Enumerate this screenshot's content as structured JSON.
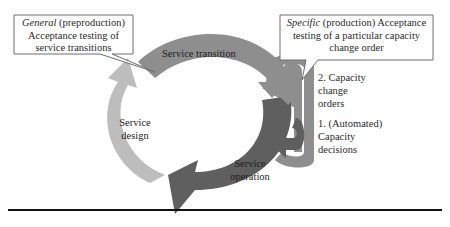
{
  "callouts": {
    "general": {
      "lead": "General",
      "rest": " (preproduction)",
      "line2": "Acceptance testing of",
      "line3": "service transitions"
    },
    "specific": {
      "lead": "Specific",
      "rest": " (production) Acceptance",
      "line2": "testing of a particular capacity",
      "line3": "change order"
    }
  },
  "cycle": {
    "transition": {
      "label": "Service transition",
      "color": "#8e8e8e"
    },
    "operation": {
      "line1": "Service",
      "line2": "operation",
      "color": "#5f5f5f"
    },
    "design": {
      "line1": "Service",
      "line2": "design",
      "color": "#bdbdbd"
    }
  },
  "loop": {
    "change_orders": {
      "line1": "2. Capacity",
      "line2": "change",
      "line3": "orders",
      "color": "#8e8e8e"
    },
    "decisions": {
      "line1": "1. (Automated)",
      "line2": "Capacity",
      "line3": "decisions",
      "color": "#5f5f5f"
    }
  },
  "colors": {
    "callout_fill": "#ffffff",
    "callout_stroke": "#6e6e6e",
    "rule": "#111111"
  }
}
